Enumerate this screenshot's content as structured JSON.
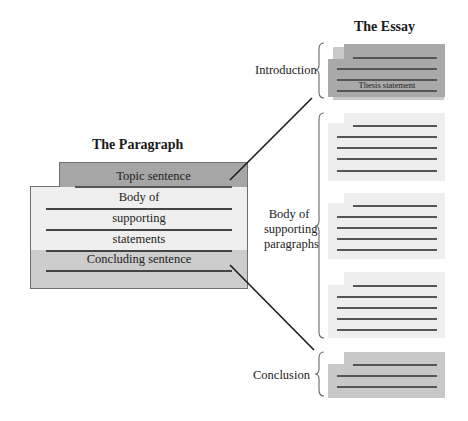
{
  "essay": {
    "title": "The Essay",
    "sections": [
      {
        "label": "Introduction",
        "special_line_text": "Thesis statement",
        "fill": "#a9a9a9"
      },
      {
        "label_lines": [
          "Body of",
          "supporting",
          "paragraphs"
        ],
        "paragraph_count": 3,
        "fill": "#eeeeee"
      },
      {
        "label": "Conclusion",
        "fill": "#c8c8c8"
      }
    ]
  },
  "paragraph": {
    "title": "The Paragraph",
    "rows": [
      "Topic sentence",
      "Body of",
      "supporting",
      "statements",
      "Concluding sentence"
    ],
    "colors": {
      "topic": "#a6a6a6",
      "body": "#efefef",
      "conclusion": "#cdcdcd"
    }
  },
  "connectors": [
    {
      "from": "Topic sentence",
      "to": "Introduction"
    },
    {
      "from": "Concluding sentence",
      "to": "Conclusion"
    }
  ]
}
